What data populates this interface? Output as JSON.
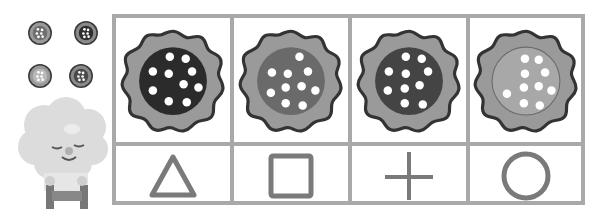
{
  "worksheet": {
    "legend": {
      "items": [
        {
          "name": "medium-cookie",
          "rim": "#888888",
          "center": "#6e6e6e"
        },
        {
          "name": "dark-cookie",
          "rim": "#888888",
          "center": "#2e2e2e"
        },
        {
          "name": "light-cookie",
          "rim": "#9a9a9a",
          "center": "#b8b8b8"
        },
        {
          "name": "dark-medium-cookie",
          "rim": "#888888",
          "center": "#4a4a4a"
        }
      ]
    },
    "mascot": "sheep",
    "columns": [
      {
        "cookie": {
          "center": "#2b2b2b",
          "rim": "#9a9a9a",
          "dots": 10
        },
        "symbol": "triangle"
      },
      {
        "cookie": {
          "center": "#6a6a6a",
          "rim": "#9a9a9a",
          "dots": 10
        },
        "symbol": "square"
      },
      {
        "cookie": {
          "center": "#444444",
          "rim": "#9a9a9a",
          "dots": 10
        },
        "symbol": "plus"
      },
      {
        "cookie": {
          "center": "#a8a8a8",
          "rim": "#9a9a9a",
          "dots": 10
        },
        "symbol": "circle"
      }
    ],
    "colors": {
      "grid": "#a9a9a9",
      "outline": "#3a3a3a",
      "symbol": "#7a7a7a"
    }
  }
}
